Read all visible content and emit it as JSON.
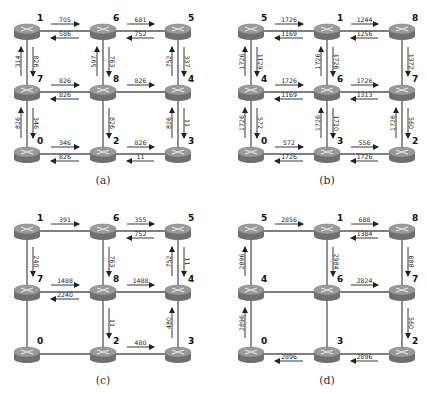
{
  "figure": {
    "panels": [
      {
        "id": "a",
        "caption": "(a)",
        "origin": [
          0,
          0
        ],
        "grid_nodes": [
          [
            "1",
            "6",
            "5"
          ],
          [
            "7",
            "8",
            "4"
          ],
          [
            "0",
            "2",
            "3"
          ]
        ],
        "flows": [
          {
            "from": "1",
            "to": "6",
            "value": "705"
          },
          {
            "from": "6",
            "to": "1",
            "value": "586"
          },
          {
            "from": "6",
            "to": "5",
            "value": "681"
          },
          {
            "from": "5",
            "to": "6",
            "value": "752"
          },
          {
            "from": "1",
            "to": "7",
            "value": "826"
          },
          {
            "from": "7",
            "to": "1",
            "value": "314"
          },
          {
            "from": "6",
            "to": "8",
            "value": "763"
          },
          {
            "from": "8",
            "to": "6",
            "value": "597"
          },
          {
            "from": "5",
            "to": "4",
            "value": "337"
          },
          {
            "from": "4",
            "to": "5",
            "value": "752"
          },
          {
            "from": "7",
            "to": "8",
            "value": "826"
          },
          {
            "from": "8",
            "to": "7",
            "value": "826"
          },
          {
            "from": "8",
            "to": "4",
            "value": "826"
          },
          {
            "from": "7",
            "to": "0",
            "value": "346"
          },
          {
            "from": "0",
            "to": "7",
            "value": "826"
          },
          {
            "from": "8",
            "to": "2",
            "value": "826"
          },
          {
            "from": "4",
            "to": "3",
            "value": "11"
          },
          {
            "from": "3",
            "to": "4",
            "value": "826"
          },
          {
            "from": "0",
            "to": "2",
            "value": "346"
          },
          {
            "from": "2",
            "to": "0",
            "value": "826"
          },
          {
            "from": "2",
            "to": "3",
            "value": "826"
          },
          {
            "from": "3",
            "to": "2",
            "value": "11"
          }
        ]
      },
      {
        "id": "b",
        "caption": "(b)",
        "origin": [
          224,
          0
        ],
        "grid_nodes": [
          [
            "5",
            "1",
            "8"
          ],
          [
            "4",
            "6",
            "7"
          ],
          [
            "0",
            "3",
            "2"
          ]
        ],
        "flows": [
          {
            "from": "5",
            "to": "1",
            "value": "1726"
          },
          {
            "from": "1",
            "to": "5",
            "value": "1169"
          },
          {
            "from": "1",
            "to": "8",
            "value": "1244"
          },
          {
            "from": "8",
            "to": "1",
            "value": "1256"
          },
          {
            "from": "5",
            "to": "4",
            "value": "1129"
          },
          {
            "from": "4",
            "to": "5",
            "value": "1726"
          },
          {
            "from": "1",
            "to": "6",
            "value": "1726"
          },
          {
            "from": "6",
            "to": "1",
            "value": "1726"
          },
          {
            "from": "8",
            "to": "7",
            "value": "1372"
          },
          {
            "from": "4",
            "to": "6",
            "value": "1726"
          },
          {
            "from": "6",
            "to": "4",
            "value": "1169"
          },
          {
            "from": "6",
            "to": "7",
            "value": "1726"
          },
          {
            "from": "7",
            "to": "6",
            "value": "1313"
          },
          {
            "from": "4",
            "to": "0",
            "value": "572"
          },
          {
            "from": "0",
            "to": "4",
            "value": "1726"
          },
          {
            "from": "6",
            "to": "3",
            "value": "1710"
          },
          {
            "from": "3",
            "to": "6",
            "value": "1726"
          },
          {
            "from": "7",
            "to": "2",
            "value": "560"
          },
          {
            "from": "2",
            "to": "7",
            "value": "1726"
          },
          {
            "from": "0",
            "to": "3",
            "value": "572"
          },
          {
            "from": "3",
            "to": "0",
            "value": "1726"
          },
          {
            "from": "3",
            "to": "2",
            "value": "556"
          },
          {
            "from": "2",
            "to": "3",
            "value": "1726"
          }
        ]
      },
      {
        "id": "c",
        "caption": "(c)",
        "origin": [
          0,
          200
        ],
        "grid_nodes": [
          [
            "1",
            "6",
            "5"
          ],
          [
            "7",
            "8",
            "4"
          ],
          [
            "0",
            "2",
            "3"
          ]
        ],
        "flows": [
          {
            "from": "1",
            "to": "6",
            "value": "391"
          },
          {
            "from": "6",
            "to": "5",
            "value": "355"
          },
          {
            "from": "5",
            "to": "6",
            "value": "752"
          },
          {
            "from": "1",
            "to": "7",
            "value": "240"
          },
          {
            "from": "6",
            "to": "8",
            "value": "763"
          },
          {
            "from": "5",
            "to": "4",
            "value": "11"
          },
          {
            "from": "4",
            "to": "5",
            "value": "752"
          },
          {
            "from": "7",
            "to": "8",
            "value": "1488"
          },
          {
            "from": "8",
            "to": "7",
            "value": "2240"
          },
          {
            "from": "8",
            "to": "4",
            "value": "1488"
          },
          {
            "from": "8",
            "to": "2",
            "value": "11"
          },
          {
            "from": "3",
            "to": "4",
            "value": "480"
          },
          {
            "from": "2",
            "to": "3",
            "value": "480"
          }
        ]
      },
      {
        "id": "d",
        "caption": "(d)",
        "origin": [
          224,
          200
        ],
        "grid_nodes": [
          [
            "5",
            "1",
            "8"
          ],
          [
            "4",
            "6",
            "7"
          ],
          [
            "0",
            "3",
            "2"
          ]
        ],
        "flows": [
          {
            "from": "5",
            "to": "1",
            "value": "2856"
          },
          {
            "from": "1",
            "to": "8",
            "value": "688"
          },
          {
            "from": "8",
            "to": "1",
            "value": "1384"
          },
          {
            "from": "4",
            "to": "5",
            "value": "2896"
          },
          {
            "from": "1",
            "to": "6",
            "value": "2984"
          },
          {
            "from": "8",
            "to": "7",
            "value": "688"
          },
          {
            "from": "6",
            "to": "7",
            "value": "2824"
          },
          {
            "from": "0",
            "to": "4",
            "value": "2896"
          },
          {
            "from": "7",
            "to": "2",
            "value": "560"
          },
          {
            "from": "3",
            "to": "0",
            "value": "2896"
          },
          {
            "from": "2",
            "to": "3",
            "value": "2896"
          }
        ]
      }
    ],
    "colors": {
      "router_top": "#9a9a9a",
      "router_side": "#6f6f6f",
      "router_glyph": "#e6e6e6",
      "link": "#555555",
      "arrow": "#222222",
      "background": "#ffffff"
    },
    "icon": "router-icon"
  }
}
